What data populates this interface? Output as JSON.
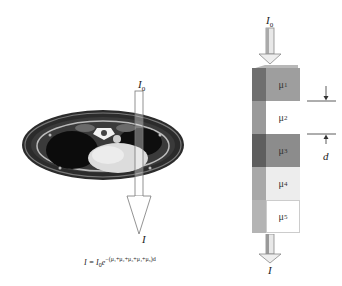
{
  "left_panel": {
    "incident_label": "I",
    "incident_sub": "0",
    "exit_label": "I",
    "image_description": "axial CT slice of the chest"
  },
  "formula": {
    "lhs": "I = I",
    "sub": "0",
    "base": "e",
    "exponent": "−(μ₁+μ₂+μ₃+μ₄+μ₅)d"
  },
  "right_panel": {
    "incident_label": "I",
    "incident_sub": "0",
    "exit_label": "I",
    "thickness_label": "d",
    "blocks": [
      {
        "label": "μ",
        "sub": "1",
        "front": "#9e9e9e",
        "side": "#6f6f6f"
      },
      {
        "label": "μ",
        "sub": "2",
        "front": "#ffffff",
        "side": "#9a9a9a"
      },
      {
        "label": "μ",
        "sub": "3",
        "front": "#8c8c8c",
        "side": "#5e5e5e"
      },
      {
        "label": "μ",
        "sub": "4",
        "front": "#ededed",
        "side": "#a8a8a8"
      },
      {
        "label": "μ",
        "sub": "5",
        "front": "#ffffff",
        "side": "#b4b4b4"
      }
    ]
  }
}
